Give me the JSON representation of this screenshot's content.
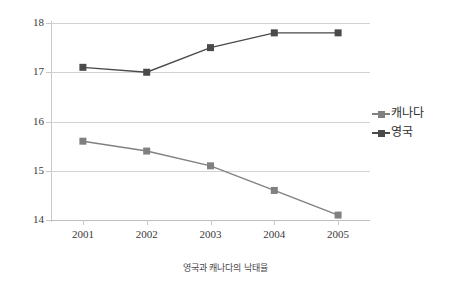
{
  "caption": "영국과 캐나다의 낙태율",
  "legend": {
    "position": "right",
    "items": [
      {
        "label": "캐나다",
        "color": "#808080"
      },
      {
        "label": "영국",
        "color": "#4a4a4a"
      }
    ]
  },
  "axes": {
    "y_ticks": [
      "18",
      "17",
      "16",
      "15",
      "14"
    ],
    "x_ticks": [
      "2001",
      "2002",
      "2003",
      "2004",
      "2005"
    ]
  },
  "chart_data": {
    "type": "line",
    "title": "",
    "subtitle": "",
    "caption": "영국과 캐나다의 낙태율",
    "xlabel": "",
    "ylabel": "",
    "categories": [
      "2001",
      "2002",
      "2003",
      "2004",
      "2005"
    ],
    "series": [
      {
        "name": "캐나다",
        "color": "#808080",
        "marker": "square",
        "values": [
          15.6,
          15.4,
          15.1,
          14.6,
          14.1
        ]
      },
      {
        "name": "영국",
        "color": "#4a4a4a",
        "marker": "square",
        "values": [
          17.1,
          17.0,
          17.5,
          17.8,
          17.8
        ]
      }
    ],
    "ylim": [
      14,
      18
    ],
    "ytick_values": [
      14,
      15,
      16,
      17,
      18
    ],
    "grid": true,
    "grid_axis": "y",
    "legend_position": "right"
  }
}
